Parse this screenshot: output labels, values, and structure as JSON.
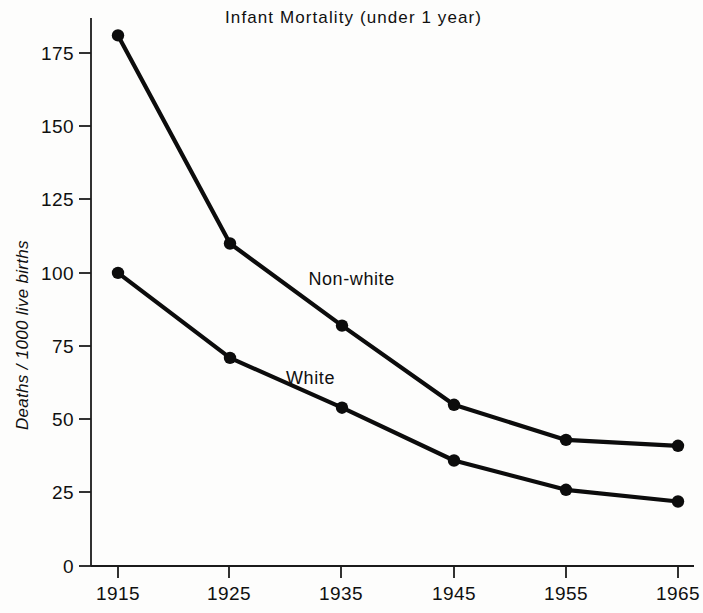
{
  "chart_data": {
    "type": "line",
    "title": "Infant  Mortality  (under 1 year)",
    "xlabel": "",
    "ylabel": "Deaths / 1000 live births",
    "x": [
      1915,
      1925,
      1935,
      1945,
      1955,
      1965
    ],
    "categories": [
      "1915",
      "1925",
      "1935",
      "1945",
      "1955",
      "1965"
    ],
    "series": [
      {
        "name": "Non-white",
        "values": [
          181,
          110,
          82,
          55,
          43,
          41
        ]
      },
      {
        "name": "White",
        "values": [
          100,
          71,
          54,
          36,
          26,
          22
        ]
      }
    ],
    "xlim": [
      1915,
      1965
    ],
    "ylim": [
      0,
      185
    ],
    "yticks": [
      "0",
      "25",
      "50",
      "75",
      "100",
      "125",
      "150",
      "175"
    ],
    "ytick_values": [
      0,
      25,
      50,
      75,
      100,
      125,
      150,
      175
    ],
    "grid": false,
    "legend": "inline-annotations",
    "annotations": [
      {
        "text": "Non-white",
        "x": 1932,
        "y": 96
      },
      {
        "text": "White",
        "x": 1930,
        "y": 62
      }
    ]
  },
  "axes": {
    "y_axis_title": "Deaths / 1000 live births",
    "x_tick_labels": [
      "1915",
      "1925",
      "1935",
      "1945",
      "1955",
      "1965"
    ],
    "y_tick_labels": [
      "175",
      "150",
      "125",
      "100",
      "75",
      "50",
      "25",
      "0"
    ]
  },
  "figure": {
    "title": "Infant  Mortality  (under 1 year)"
  }
}
